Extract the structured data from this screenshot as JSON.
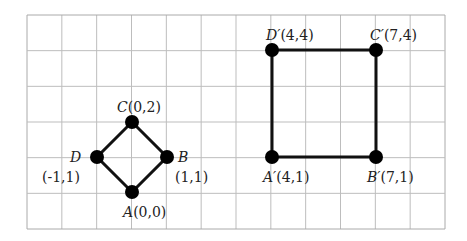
{
  "grid": {
    "left": 27,
    "top": 15,
    "right": 445,
    "bottom": 229,
    "cols": 12,
    "rows": 6,
    "line_color": "#bdbdbd",
    "border_color": "#aaaaaa"
  },
  "shapes": [
    {
      "name": "original-square",
      "points": [
        {
          "id": "A",
          "label": "A",
          "coord": "(0,0)",
          "x": 132,
          "y": 192
        },
        {
          "id": "B",
          "label": "B",
          "coord": "(1,1)",
          "x": 167,
          "y": 157
        },
        {
          "id": "C",
          "label": "C",
          "coord": "(0,2)",
          "x": 132,
          "y": 122
        },
        {
          "id": "D",
          "label": "D",
          "coord": "(-1,1)",
          "x": 97,
          "y": 157
        }
      ]
    },
    {
      "name": "transformed-square",
      "points": [
        {
          "id": "A'",
          "label": "A′",
          "coord": "(4,1)",
          "x": 272,
          "y": 157
        },
        {
          "id": "B'",
          "label": "B′",
          "coord": "(7,1)",
          "x": 376,
          "y": 157
        },
        {
          "id": "C'",
          "label": "C′",
          "coord": "(7,4)",
          "x": 376,
          "y": 50
        },
        {
          "id": "D'",
          "label": "D′",
          "coord": "(4,4)",
          "x": 272,
          "y": 50
        }
      ]
    }
  ],
  "labels": {
    "C": {
      "name": "C",
      "coord": "(0,2)"
    },
    "D": {
      "name": "D",
      "coord": "(-1,1)"
    },
    "B": {
      "name": "B",
      "coord": "(1,1)"
    },
    "A": {
      "name": "A",
      "coord": "(0,0)"
    },
    "Dp": {
      "name": "D′",
      "coord": "(4,4)"
    },
    "Cp": {
      "name": "C′",
      "coord": "(7,4)"
    },
    "Ap": {
      "name": "A′",
      "coord": "(4,1)"
    },
    "Bp": {
      "name": "B′",
      "coord": "(7,1)"
    }
  },
  "colors": {
    "stroke": "#111111",
    "dot": "#000000"
  }
}
